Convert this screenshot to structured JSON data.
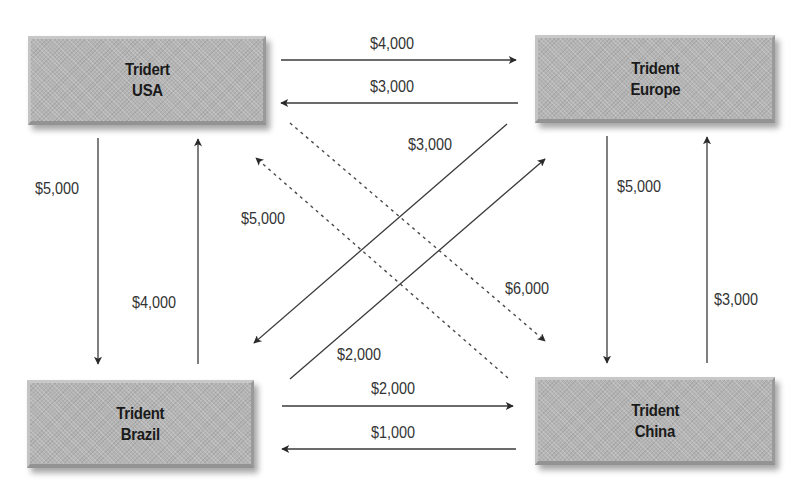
{
  "entities": {
    "usa": {
      "line1": "Tridert",
      "line2": "USA"
    },
    "europe": {
      "line1": "Trident",
      "line2": "Europe"
    },
    "brazil": {
      "line1": "Trident",
      "line2": "Brazil"
    },
    "china": {
      "line1": "Trident",
      "line2": "China"
    }
  },
  "flows": {
    "usa_to_europe": {
      "amount": "$4,000",
      "style": "solid"
    },
    "europe_to_usa": {
      "amount": "$3,000",
      "style": "solid"
    },
    "usa_to_brazil": {
      "amount": "$5,000",
      "style": "solid"
    },
    "brazil_to_usa": {
      "amount": "$4,000",
      "style": "solid"
    },
    "europe_to_china": {
      "amount": "$5,000",
      "style": "solid"
    },
    "china_to_europe": {
      "amount": "$3,000",
      "style": "solid"
    },
    "brazil_to_china": {
      "amount": "$2,000",
      "style": "solid"
    },
    "china_to_brazil": {
      "amount": "$1,000",
      "style": "solid"
    },
    "europe_to_brazil": {
      "amount": "$3,000",
      "style": "solid"
    },
    "brazil_to_europe": {
      "amount": "$2,000",
      "style": "solid"
    },
    "china_to_usa": {
      "amount": "$5,000",
      "style": "dashed"
    },
    "usa_to_china": {
      "amount": "$6,000",
      "style": "dashed"
    }
  },
  "colors": {
    "box_fill": "#b4b4b4",
    "arrow": "#3a3a3a",
    "label_text": "#333333",
    "box_text": "#1a1a1a"
  }
}
